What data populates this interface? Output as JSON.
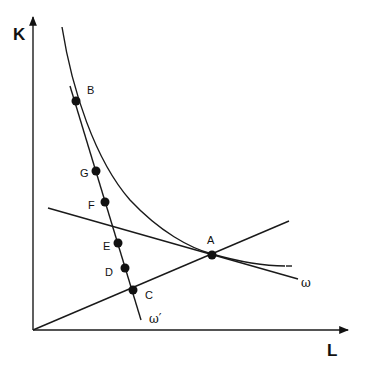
{
  "diagram": {
    "axes": {
      "y_label": "K",
      "x_label": "L"
    },
    "curves": {
      "isoquant": {
        "name": "isoquant"
      },
      "omega": {
        "label": "ω"
      },
      "omega_prime": {
        "label": "ω′"
      },
      "ray": {
        "name": "expansion-ray"
      }
    },
    "points": [
      {
        "id": "A",
        "label": "A"
      },
      {
        "id": "B",
        "label": "B"
      },
      {
        "id": "C",
        "label": "C"
      },
      {
        "id": "D",
        "label": "D"
      },
      {
        "id": "E",
        "label": "E"
      },
      {
        "id": "F",
        "label": "F"
      },
      {
        "id": "G",
        "label": "G"
      }
    ]
  }
}
